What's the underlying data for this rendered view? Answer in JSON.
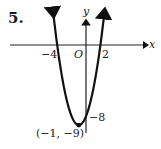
{
  "problem_number": "5.",
  "chart_data": {
    "type": "line",
    "title": "",
    "function": "y = x^2 + 2x - 8",
    "xlabel": "x",
    "ylabel": "y",
    "origin_label": "O",
    "x_tick_labels": [
      "-4",
      "2"
    ],
    "y_tick_labels": [
      "-8"
    ],
    "x_intercepts": [
      -4,
      2
    ],
    "y_intercept": -8,
    "vertex": {
      "x": -1,
      "y": -9,
      "label": "(−1, −9)"
    },
    "grid": false,
    "legend": null
  },
  "labels": {
    "x_axis": "x",
    "y_axis": "y",
    "origin": "O",
    "x_tick_neg4": "−4",
    "x_tick_2": "2",
    "y_tick_neg8": "−8",
    "vertex": "(−1, −9)"
  }
}
